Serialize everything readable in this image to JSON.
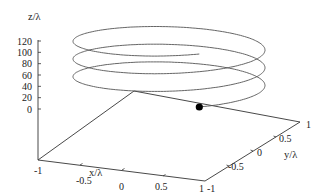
{
  "chart_data": {
    "type": "line",
    "subtype": "3d-parametric-helix",
    "title": "",
    "xlabel": "x/λ",
    "ylabel": "y/λ",
    "zlabel": "z/λ",
    "xlim": [
      -1,
      1
    ],
    "ylim": [
      -1,
      1
    ],
    "zlim": [
      0,
      120
    ],
    "x_ticks": [
      "-1",
      "-0.5",
      "0",
      "0.5",
      "1"
    ],
    "y_ticks": [
      "-1",
      "-0.5",
      "0",
      "0.5",
      "1"
    ],
    "z_ticks": [
      "0",
      "20",
      "40",
      "60",
      "80",
      "100",
      "120"
    ],
    "grid": false,
    "legend": null,
    "series": [
      {
        "name": "helix",
        "description": "Circular helix of radius 1λ, 3 turns, rising from z=0 to z≈120λ",
        "radius": 1,
        "turns": 3,
        "z_start": 0,
        "z_end": 120,
        "color": "#555555"
      }
    ],
    "markers": [
      {
        "name": "start-point",
        "x": 0.4,
        "y": 0.9,
        "z": 0,
        "color": "#000000"
      }
    ]
  },
  "colors": {
    "axis": "#333333",
    "curve": "#555555",
    "marker": "#000000"
  }
}
